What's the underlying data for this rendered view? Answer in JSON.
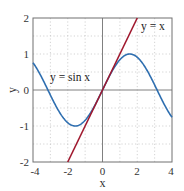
{
  "chart_data": {
    "type": "line",
    "title": "",
    "xlabel": "x",
    "ylabel": "y",
    "xlim": [
      -4,
      4
    ],
    "ylim": [
      -2,
      2
    ],
    "xticks": [
      -4,
      -2,
      0,
      2,
      4
    ],
    "yticks": [
      -2,
      -1,
      0,
      1,
      2
    ],
    "xtick_labels": [
      "-4",
      "-2",
      "0",
      "2",
      "4"
    ],
    "ytick_labels": [
      "-2",
      "-1",
      "0",
      "1",
      "2"
    ],
    "grid": true,
    "grid_style": "dotted",
    "minor_grid_step": 1,
    "zero_axes": true,
    "legend": "none (inline annotations)",
    "series": [
      {
        "name": "y = sin x",
        "function": "sin(x)",
        "color": "#2f6fb0",
        "x": [
          -4,
          -3.5,
          -3,
          -2.5,
          -2,
          -1.5708,
          -1,
          -0.5,
          0,
          0.5,
          1,
          1.5708,
          2,
          2.5,
          3,
          3.5,
          4
        ],
        "y": [
          0.757,
          0.351,
          -0.141,
          -0.598,
          -0.909,
          -1.0,
          -0.841,
          -0.479,
          0,
          0.479,
          0.841,
          1.0,
          0.909,
          0.598,
          0.141,
          -0.351,
          -0.757
        ]
      },
      {
        "name": "y = x",
        "function": "x",
        "color": "#a0182e",
        "x": [
          -2,
          2
        ],
        "y": [
          -2,
          2
        ]
      }
    ],
    "annotations": [
      {
        "text": "y = x",
        "x": 2.5,
        "y": 1.75
      },
      {
        "text": "y = sin x",
        "x": -2.5,
        "y": 0.45
      }
    ]
  },
  "labels": {
    "xlabel": "x",
    "ylabel": "y",
    "annot_line": "y = x",
    "annot_sin": "y = sin x",
    "xticks": [
      "-4",
      "-2",
      "0",
      "2",
      "4"
    ],
    "yticks": [
      "2",
      "1",
      "0",
      "-1",
      "-2"
    ]
  }
}
